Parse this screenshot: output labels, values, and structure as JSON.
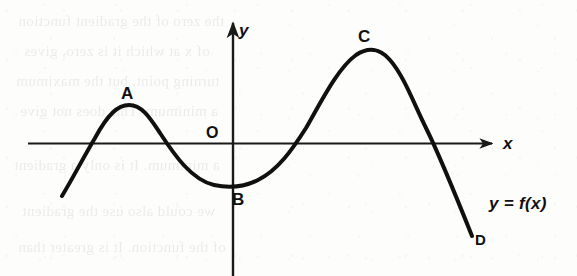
{
  "figure": {
    "caption_label": "y = f(x)",
    "origin_label": "O",
    "axis_x_label": "x",
    "axis_y_label": "y",
    "curve_color": "#101010",
    "axis_color": "#1a1a1a",
    "background_color": "#fdfdfc"
  },
  "points": {
    "a": "A",
    "b": "B",
    "c": "C",
    "d": "D"
  },
  "ghost_text": {
    "lines": [
      "the zero of the gradient function",
      "of x at which it is zero, gives",
      "turning point, but the maximum",
      "a minimum. This does not give",
      "a minimum. It is only a gradient",
      "we could also use the gradient",
      "of the function. It is greater than"
    ]
  },
  "chart_data": {
    "type": "line",
    "title": "",
    "xlabel": "x",
    "ylabel": "y",
    "grid": false,
    "legend": [
      "y = f(x)"
    ],
    "annotations": [
      {
        "label": "A",
        "role": "local-maximum",
        "x": 128,
        "y": 105
      },
      {
        "label": "B",
        "role": "local-minimum",
        "x": 236,
        "y": 186
      },
      {
        "label": "C",
        "role": "local-maximum",
        "x": 366,
        "y": 51
      },
      {
        "label": "D",
        "role": "curve-endpoint",
        "x": 472,
        "y": 236
      },
      {
        "label": "O",
        "role": "origin",
        "x": 233,
        "y": 143
      }
    ],
    "x_intercepts": [
      85,
      178,
      305,
      437
    ],
    "axis_x_range": [
      28,
      495
    ],
    "axis_y_range": [
      20,
      276
    ],
    "curve_path": "M 62,196 C 74,176 82,160 95,138 C 108,114 118,105 129,105 C 142,105 150,118 160,133 C 175,156 192,180 214,185 C 228,188 244,187 258,180 C 278,170 292,150 306,128 C 322,100 338,68 356,55 C 368,47 380,48 390,60 C 404,76 414,104 426,128 C 438,152 456,196 472,236"
  }
}
